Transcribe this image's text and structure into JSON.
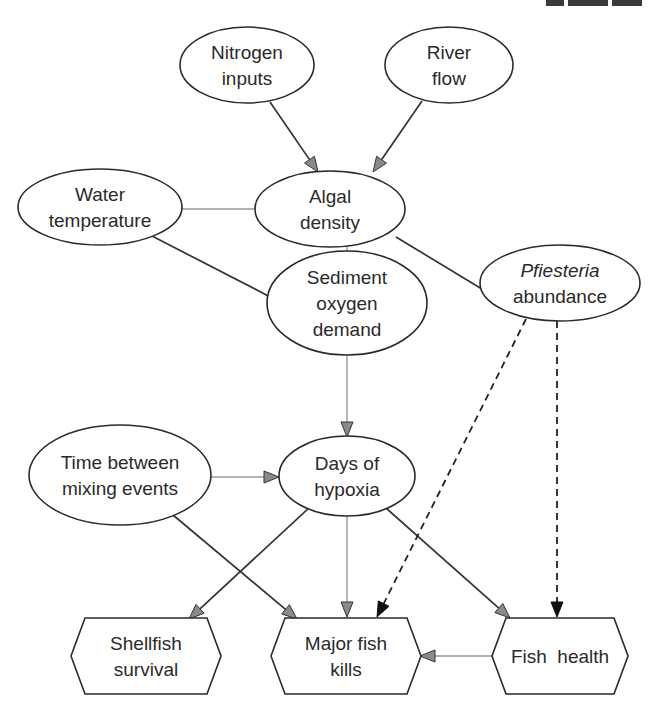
{
  "figure": {
    "type": "influence-diagram",
    "nodes": [
      {
        "id": "nitrogen-inputs",
        "shape": "ellipse",
        "lines": [
          "Nitrogen",
          "inputs"
        ],
        "italic": [
          false,
          false
        ]
      },
      {
        "id": "river-flow",
        "shape": "ellipse",
        "lines": [
          "River",
          "flow"
        ],
        "italic": [
          false,
          false
        ]
      },
      {
        "id": "water-temperature",
        "shape": "ellipse",
        "lines": [
          "Water",
          "temperature"
        ],
        "italic": [
          false,
          false
        ]
      },
      {
        "id": "algal-density",
        "shape": "ellipse",
        "lines": [
          "Algal",
          "density"
        ],
        "italic": [
          false,
          false
        ]
      },
      {
        "id": "sediment-oxygen-demand",
        "shape": "ellipse",
        "lines": [
          "Sediment",
          "oxygen",
          "demand"
        ],
        "italic": [
          false,
          false,
          false
        ]
      },
      {
        "id": "pfiesteria-abundance",
        "shape": "ellipse",
        "lines": [
          "Pfiesteria",
          "abundance"
        ],
        "italic": [
          true,
          false
        ]
      },
      {
        "id": "time-between-mixing-events",
        "shape": "ellipse",
        "lines": [
          "Time between",
          "mixing events"
        ],
        "italic": [
          false,
          false
        ]
      },
      {
        "id": "days-of-hypoxia",
        "shape": "ellipse",
        "lines": [
          "Days of",
          "hypoxia"
        ],
        "italic": [
          false,
          false
        ]
      },
      {
        "id": "shellfish-survival",
        "shape": "hexagon",
        "lines": [
          "Shellfish",
          "survival"
        ],
        "italic": [
          false,
          false
        ]
      },
      {
        "id": "major-fish-kills",
        "shape": "hexagon",
        "lines": [
          "Major fish",
          "kills"
        ],
        "italic": [
          false,
          false
        ]
      },
      {
        "id": "fish-health",
        "shape": "hexagon",
        "lines": [
          "Fish  health"
        ],
        "italic": [
          false
        ]
      }
    ],
    "edges": [
      {
        "from": "nitrogen-inputs",
        "to": "algal-density",
        "style": "solid"
      },
      {
        "from": "river-flow",
        "to": "algal-density",
        "style": "solid"
      },
      {
        "from": "water-temperature",
        "to": "algal-density",
        "style": "light"
      },
      {
        "from": "water-temperature",
        "to": "sediment-oxygen-demand",
        "style": "solid"
      },
      {
        "from": "algal-density",
        "to": "sediment-oxygen-demand",
        "style": "light"
      },
      {
        "from": "algal-density",
        "to": "pfiesteria-abundance",
        "style": "solid"
      },
      {
        "from": "sediment-oxygen-demand",
        "to": "days-of-hypoxia",
        "style": "light"
      },
      {
        "from": "time-between-mixing-events",
        "to": "days-of-hypoxia",
        "style": "light"
      },
      {
        "from": "time-between-mixing-events",
        "to": "major-fish-kills",
        "style": "solid"
      },
      {
        "from": "days-of-hypoxia",
        "to": "shellfish-survival",
        "style": "solid"
      },
      {
        "from": "days-of-hypoxia",
        "to": "major-fish-kills",
        "style": "light"
      },
      {
        "from": "days-of-hypoxia",
        "to": "fish-health",
        "style": "solid"
      },
      {
        "from": "pfiesteria-abundance",
        "to": "major-fish-kills",
        "style": "dashed"
      },
      {
        "from": "pfiesteria-abundance",
        "to": "fish-health",
        "style": "dashed"
      },
      {
        "from": "fish-health",
        "to": "major-fish-kills",
        "style": "light"
      }
    ],
    "colors": {
      "stroke": "#2a2a2a",
      "arrowhead_grey": "#8a8a8a",
      "arrowhead_black": "#111111",
      "light_edge": "#9a9a9a"
    }
  }
}
